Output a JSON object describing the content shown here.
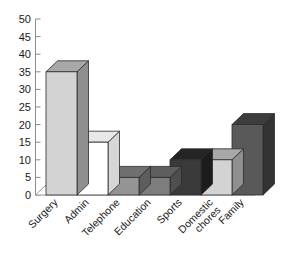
{
  "chart_data": {
    "type": "bar",
    "title": "",
    "subtitle": "",
    "xlabel": "",
    "ylabel": "",
    "categories": [
      "Surgery",
      "Admin",
      "Telephone",
      "Education",
      "Sports",
      "Domestic chores",
      "Family"
    ],
    "values": [
      35,
      15,
      5,
      5,
      10,
      10,
      20
    ],
    "ylim": [
      0,
      50
    ],
    "ytick_values": [
      0,
      5,
      10,
      15,
      20,
      25,
      30,
      35,
      40,
      45,
      50
    ],
    "ytick_labels": [
      "0",
      "5",
      "10",
      "15",
      "20",
      "25",
      "30",
      "35",
      "40",
      "45",
      "50"
    ],
    "grid": false,
    "legend": false,
    "legend_position": "none",
    "style": "3d-column",
    "bar_colors": [
      "#d3d3d3",
      "#ffffff",
      "#949494",
      "#7d7d7d",
      "#3a3a3a",
      "#d3d3d3",
      "#595959"
    ],
    "bar_top_colors": [
      "#a8a8a8",
      "#e8e8e8",
      "#6f6f6f",
      "#5e5e5e",
      "#242424",
      "#a8a8a8",
      "#3d3d3d"
    ],
    "bar_side_colors": [
      "#8f8f8f",
      "#d6d6d6",
      "#5d5d5d",
      "#4e4e4e",
      "#1c1c1c",
      "#8f8f8f",
      "#333333"
    ],
    "category_label_lines": [
      [
        "Surgery"
      ],
      [
        "Admin"
      ],
      [
        "Telephone"
      ],
      [
        "Education"
      ],
      [
        "Sports"
      ],
      [
        "Domestic",
        "chores"
      ],
      [
        "Family"
      ]
    ]
  }
}
